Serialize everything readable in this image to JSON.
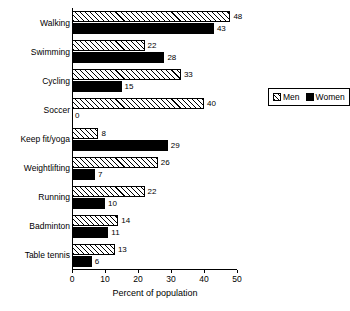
{
  "chart_data": {
    "type": "bar",
    "orientation": "horizontal",
    "title": "",
    "xlabel": "Percent of population",
    "ylabel": "",
    "xlim": [
      0,
      50
    ],
    "xticks": [
      0,
      10,
      20,
      30,
      40,
      50
    ],
    "grid": false,
    "legend_position": "right",
    "categories": [
      "Walking",
      "Swimming",
      "Cycling",
      "Soccer",
      "Keep fit/yoga",
      "Weightlifting",
      "Running",
      "Badminton",
      "Table tennis"
    ],
    "series": [
      {
        "name": "Men",
        "fill": "hatched",
        "values": [
          48,
          22,
          33,
          40,
          8,
          26,
          22,
          14,
          13
        ]
      },
      {
        "name": "Women",
        "fill": "solid-black",
        "values": [
          43,
          28,
          15,
          0,
          29,
          7,
          10,
          11,
          6
        ]
      }
    ]
  },
  "legend": {
    "items": [
      {
        "label": "Men",
        "swatch": "hatched-swatch-icon"
      },
      {
        "label": "Women",
        "swatch": "solid-black-swatch-icon"
      }
    ]
  },
  "colors": {
    "axis": "#000000",
    "bar_outline": "#000000",
    "women_fill": "#000000",
    "men_fill": "#ffffff",
    "background": "#ffffff"
  }
}
